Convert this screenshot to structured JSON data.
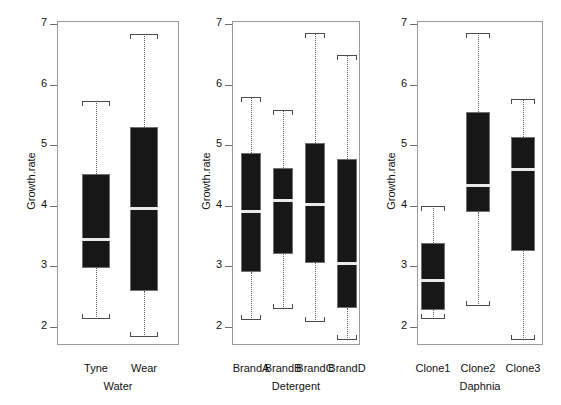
{
  "figure": {
    "type": "boxplot-panels",
    "background": "#ffffff",
    "box_fill": "#171717",
    "median_color": "#e9e9e9",
    "frame_color": "#9a9a9a",
    "whisker_style": "dotted"
  },
  "chart_data": {
    "type": "box",
    "title": "",
    "ylabel": "Growth.rate",
    "ylim": [
      1.6,
      7.25
    ],
    "yticks": [
      2,
      3,
      4,
      5,
      6,
      7
    ],
    "ytick_labels": [
      "2",
      "3",
      "4",
      "5",
      "6",
      "7"
    ],
    "grid": false,
    "legend": "none",
    "panels": [
      {
        "xlabel": "Water",
        "ylabel": "Growth.rate",
        "categories": [
          "Tyne",
          "Wear"
        ],
        "boxes": [
          {
            "label": "Tyne",
            "whisker_low": 2.13,
            "q1": 2.98,
            "median": 3.44,
            "q3": 4.53,
            "whisker_high": 5.73
          },
          {
            "label": "Wear",
            "whisker_low": 1.83,
            "q1": 2.59,
            "median": 3.96,
            "q3": 5.3,
            "whisker_high": 6.83
          }
        ]
      },
      {
        "xlabel": "Detergent",
        "ylabel": "Growth.rate",
        "categories": [
          "BrandA",
          "BrandB",
          "BrandC",
          "BrandD"
        ],
        "boxes": [
          {
            "label": "BrandA",
            "whisker_low": 2.11,
            "q1": 2.91,
            "median": 3.9,
            "q3": 4.87,
            "whisker_high": 5.8
          },
          {
            "label": "BrandB",
            "whisker_low": 2.29,
            "q1": 3.2,
            "median": 4.08,
            "q3": 4.63,
            "whisker_high": 5.58
          },
          {
            "label": "BrandC",
            "whisker_low": 2.08,
            "q1": 3.05,
            "median": 4.02,
            "q3": 5.03,
            "whisker_high": 6.85
          },
          {
            "label": "BrandD",
            "whisker_low": 1.78,
            "q1": 2.31,
            "median": 3.05,
            "q3": 4.77,
            "whisker_high": 6.49
          }
        ]
      },
      {
        "xlabel": "Daphnia",
        "ylabel": "Growth.rate",
        "categories": [
          "Clone1",
          "Clone2",
          "Clone3"
        ],
        "boxes": [
          {
            "label": "Clone1",
            "whisker_low": 2.13,
            "q1": 2.28,
            "median": 2.77,
            "q3": 3.39,
            "whisker_high": 3.99
          },
          {
            "label": "Clone2",
            "whisker_low": 2.35,
            "q1": 3.9,
            "median": 4.33,
            "q3": 5.54,
            "whisker_high": 6.85
          },
          {
            "label": "Clone3",
            "whisker_low": 1.78,
            "q1": 3.25,
            "median": 4.6,
            "q3": 5.13,
            "whisker_high": 5.77
          }
        ]
      }
    ]
  }
}
